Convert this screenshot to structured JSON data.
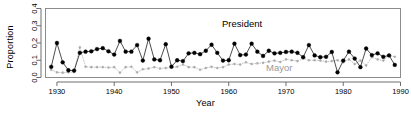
{
  "chart_data": {
    "type": "line",
    "title": "",
    "xlabel": "Year",
    "ylabel": "Proportion",
    "xlim": [
      1928,
      1990
    ],
    "ylim": [
      0.0,
      0.4
    ],
    "xticks": [
      1930,
      1940,
      1950,
      1960,
      1970,
      1980,
      1990
    ],
    "xticklabels": [
      "1930",
      "1940",
      "1950",
      "1960",
      "1970",
      "1980",
      "1990"
    ],
    "yticks": [
      0.0,
      0.1,
      0.2,
      0.3,
      0.4
    ],
    "yticklabels": [
      "0.0",
      "0.1",
      "0.2",
      "0.3",
      "0.4"
    ],
    "grid": false,
    "legend_position": "inline-annotations",
    "frame": true,
    "annotations": [
      {
        "text": "President",
        "x": 1958,
        "y": 0.285,
        "color": "#000000"
      },
      {
        "text": "Mayor",
        "x": 1971,
        "y": 0.035,
        "color": "#9a9a9a"
      }
    ],
    "x": [
      1929,
      1930,
      1931,
      1932,
      1933,
      1934,
      1935,
      1936,
      1937,
      1938,
      1939,
      1940,
      1941,
      1942,
      1943,
      1944,
      1945,
      1946,
      1947,
      1948,
      1949,
      1950,
      1951,
      1952,
      1953,
      1954,
      1955,
      1956,
      1957,
      1958,
      1959,
      1960,
      1961,
      1962,
      1963,
      1964,
      1965,
      1966,
      1967,
      1968,
      1969,
      1970,
      1971,
      1972,
      1973,
      1974,
      1975,
      1976,
      1977,
      1978,
      1979,
      1980,
      1981,
      1982,
      1983,
      1984,
      1985,
      1986,
      1987,
      1988,
      1989
    ],
    "series": [
      {
        "name": "President",
        "color": "#000000",
        "marker": "filled-circle",
        "linestyle": "solid",
        "values": [
          0.062,
          0.2,
          0.088,
          0.042,
          0.04,
          0.143,
          0.15,
          0.152,
          0.165,
          0.17,
          0.152,
          0.133,
          0.212,
          0.15,
          0.15,
          0.188,
          0.098,
          0.225,
          0.105,
          0.1,
          0.193,
          0.063,
          0.1,
          0.095,
          0.14,
          0.143,
          0.135,
          0.155,
          0.19,
          0.143,
          0.098,
          0.1,
          0.196,
          0.13,
          0.133,
          0.196,
          0.15,
          0.125,
          0.155,
          0.14,
          0.143,
          0.148,
          0.15,
          0.143,
          0.118,
          0.188,
          0.128,
          0.118,
          0.12,
          0.148,
          0.03,
          0.098,
          0.15,
          0.11,
          0.06,
          0.168,
          0.13,
          0.14,
          0.12,
          0.128,
          0.073
        ]
      },
      {
        "name": "Mayor",
        "color": "#aaaaaa",
        "marker": "small-dot",
        "linestyle": "dotted",
        "values": [
          0.045,
          0.03,
          0.028,
          0.03,
          0.032,
          0.175,
          0.062,
          0.06,
          0.06,
          0.06,
          0.058,
          0.06,
          0.028,
          0.06,
          0.062,
          0.03,
          0.048,
          0.052,
          0.06,
          0.052,
          0.055,
          0.058,
          0.062,
          0.075,
          0.06,
          0.06,
          0.045,
          0.055,
          0.062,
          0.055,
          0.06,
          0.075,
          0.078,
          0.075,
          0.088,
          0.078,
          0.082,
          0.085,
          0.092,
          0.098,
          0.09,
          0.105,
          0.1,
          0.095,
          0.11,
          0.1,
          0.1,
          0.098,
          0.092,
          0.095,
          0.1,
          0.088,
          0.105,
          0.078,
          0.098,
          0.07,
          0.118,
          0.105,
          0.098,
          0.128,
          0.12
        ]
      }
    ]
  }
}
